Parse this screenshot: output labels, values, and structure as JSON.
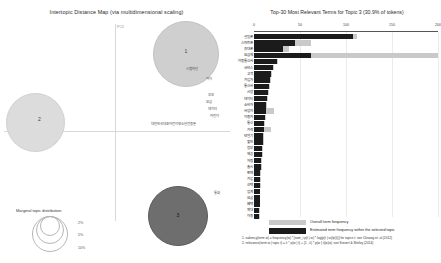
{
  "left_panel": {
    "title": "Intertopic Distance Map (via multidimensional scaling)",
    "axes": {
      "x_label": "PC1",
      "y_label": "PC2"
    },
    "topics": [
      {
        "id": "1",
        "label": "1"
      },
      {
        "id": "2",
        "label": "2"
      },
      {
        "id": "3",
        "label": "3"
      }
    ],
    "map_terms": [
      "스팸차단",
      "아이",
      "부모",
      "요금",
      "데이터",
      "어린이",
      "대한민국대표어린이청소년전용폰",
      "통화"
    ],
    "marginal_legend": {
      "title": "Marginal topic distribution",
      "sizes": [
        "2%",
        "5%",
        "10%"
      ]
    }
  },
  "right_panel": {
    "title": "Top-30 Most Relevant Terms for Topic 3 (30.9% of tokens)",
    "x_ticks": [
      "0",
      "50",
      "100",
      "150",
      "200"
    ],
    "legend": [
      {
        "key": "overall",
        "label": "Overall term frequency"
      },
      {
        "key": "topic",
        "label": "Estimated term frequency within the selected topic"
      }
    ],
    "footnotes": [
      "1. saliency(term w) = frequency(w) * [sum_t p(t | w) * log(p(t | w)/p(t))] for topics t; see Chuang et. al (2012)",
      "2. relevance(term w | topic t) = λ * p(w | t) + (1 - λ) * p(w | t)/p(w); see Sievert & Shirley (2014)"
    ]
  },
  "chart_data": {
    "type": "bar",
    "title": "Top-30 Most Relevant Terms for Topic 3 (30.9% of tokens)",
    "xlabel": "",
    "ylabel": "",
    "xlim": [
      0,
      200
    ],
    "grid": true,
    "legend_position": "bottom",
    "categories": [
      "알뜰폰",
      "스마트폰",
      "휴대폰",
      "요금제",
      "이동통신사",
      "서비스",
      "고객",
      "가입자",
      "통신사",
      "시장",
      "데이터",
      "소비자",
      "사업자",
      "이용자",
      "통신",
      "가격",
      "단말기",
      "할인",
      "정부",
      "제공",
      "저렴",
      "출시",
      "판매",
      "가입",
      "선택",
      "업계",
      "요금",
      "혜택",
      "확대",
      "이용"
    ],
    "series": [
      {
        "name": "Overall term frequency",
        "values": [
          112,
          62,
          38,
          200,
          26,
          22,
          20,
          18,
          17,
          16,
          15,
          14,
          22,
          13,
          12,
          18,
          11,
          11,
          10,
          10,
          9,
          9,
          8,
          8,
          8,
          7,
          7,
          7,
          6,
          6
        ]
      },
      {
        "name": "Estimated term frequency within the selected topic",
        "values": [
          108,
          45,
          32,
          62,
          25,
          21,
          19,
          17,
          16,
          15,
          14,
          13,
          13,
          12,
          11,
          11,
          10,
          10,
          9,
          9,
          8,
          8,
          7,
          7,
          7,
          6,
          6,
          6,
          5,
          5
        ]
      }
    ]
  }
}
